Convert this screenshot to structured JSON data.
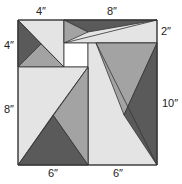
{
  "diagram": {
    "colors": {
      "dark": "#5a5a5a",
      "mid": "#a3a3a3",
      "light": "#e4e4e4",
      "white": "#ffffff",
      "stroke": "#333333"
    },
    "labels": {
      "top_left": "4″",
      "top_right": "8″",
      "left_top": "4″",
      "right_top": "2″",
      "left_bottom": "8″",
      "right_bottom": "10″",
      "bottom_left": "6″",
      "bottom_right": "6″"
    }
  }
}
